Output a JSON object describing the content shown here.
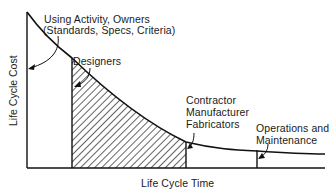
{
  "diagram": {
    "type": "life-cycle-cost-curve",
    "axes": {
      "x_label": "Life Cycle Time",
      "y_label": "Life Cycle Cost"
    },
    "labels": {
      "owners_line1": "Using Activity, Owners",
      "owners_line2": "(Standards, Specs, Criteria)",
      "designers": "Designers",
      "contractor_line1": "Contractor",
      "contractor_line2": "Manufacturer",
      "contractor_line3": "Fabricators",
      "om_line1": "Operations and",
      "om_line2": "Maintenance"
    },
    "regions": [
      {
        "name": "Using Activity, Owners",
        "x_start": 27,
        "x_end": 72,
        "fill": "none"
      },
      {
        "name": "Designers / Contractor, Manufacturer, Fabricators",
        "x_start": 72,
        "x_end": 186,
        "fill": "hatched"
      },
      {
        "name": "Operations and Maintenance",
        "x_start": 257,
        "x_end": 325,
        "fill": "none"
      }
    ],
    "colors": {
      "line": "#111111",
      "background": "#ffffff"
    }
  }
}
